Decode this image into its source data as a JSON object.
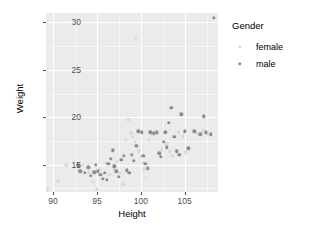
{
  "chart_data": {
    "type": "scatter",
    "title": "",
    "xlabel": "Height",
    "ylabel": "Weight",
    "xlim": [
      89.2,
      108.8
    ],
    "ylim": [
      12.1,
      31.0
    ],
    "xticks": [
      90,
      95,
      100,
      105
    ],
    "yticks": [
      15,
      20,
      25,
      30
    ],
    "grid": true,
    "legend": {
      "title": "Gender",
      "position": "right",
      "entries": [
        {
          "name": "female",
          "color": "#d9d9d9"
        },
        {
          "name": "male",
          "color": "#8c8c8c"
        }
      ]
    },
    "series": [
      {
        "name": "female",
        "color": "#d9d9d9",
        "points": [
          [
            89.4,
            12.4
          ],
          [
            90.6,
            13.3
          ],
          [
            91.5,
            14.9
          ],
          [
            93.0,
            14.4
          ],
          [
            93.4,
            15.0
          ],
          [
            94.1,
            14.2
          ],
          [
            94.6,
            13.2
          ],
          [
            95.0,
            12.4
          ],
          [
            95.3,
            14.5
          ],
          [
            95.6,
            14.0
          ],
          [
            96.0,
            15.2
          ],
          [
            96.4,
            13.9
          ],
          [
            96.9,
            14.6
          ],
          [
            97.3,
            15.3
          ],
          [
            97.6,
            14.1
          ],
          [
            98.0,
            12.9
          ],
          [
            98.3,
            17.6
          ],
          [
            98.6,
            19.7
          ],
          [
            98.9,
            18.3
          ],
          [
            99.1,
            17.9
          ],
          [
            99.3,
            17.4
          ],
          [
            99.4,
            28.4
          ],
          [
            99.6,
            16.9
          ],
          [
            99.8,
            16.4
          ],
          [
            100.0,
            15.8
          ],
          [
            100.2,
            15.2
          ],
          [
            100.4,
            14.5
          ],
          [
            100.6,
            13.6
          ],
          [
            100.9,
            17.6
          ],
          [
            101.3,
            18.2
          ],
          [
            101.9,
            18.3
          ],
          [
            102.4,
            16.6
          ],
          [
            102.9,
            17.2
          ],
          [
            103.3,
            16.4
          ],
          [
            103.6,
            15.9
          ],
          [
            104.0,
            16.5
          ],
          [
            104.3,
            18.4
          ],
          [
            104.8,
            18.0
          ],
          [
            105.1,
            16.3
          ],
          [
            106.4,
            18.3
          ],
          [
            107.1,
            18.6
          ],
          [
            107.6,
            18.3
          ]
        ]
      },
      {
        "name": "male",
        "color": "#8c8c8c",
        "points": [
          [
            92.9,
            14.9
          ],
          [
            93.1,
            14.3
          ],
          [
            93.6,
            14.1
          ],
          [
            94.0,
            14.7
          ],
          [
            94.3,
            13.8
          ],
          [
            94.7,
            14.2
          ],
          [
            94.9,
            15.0
          ],
          [
            95.1,
            14.3
          ],
          [
            95.4,
            13.9
          ],
          [
            95.7,
            13.5
          ],
          [
            95.9,
            14.1
          ],
          [
            96.1,
            13.4
          ],
          [
            96.3,
            15.1
          ],
          [
            96.6,
            15.6
          ],
          [
            96.8,
            16.5
          ],
          [
            97.0,
            14.8
          ],
          [
            97.2,
            14.3
          ],
          [
            97.5,
            13.7
          ],
          [
            97.8,
            15.5
          ],
          [
            98.1,
            15.9
          ],
          [
            98.4,
            14.4
          ],
          [
            98.7,
            14.1
          ],
          [
            99.0,
            16.0
          ],
          [
            99.2,
            15.4
          ],
          [
            99.5,
            17.0
          ],
          [
            99.7,
            18.5
          ],
          [
            100.1,
            18.4
          ],
          [
            100.3,
            15.9
          ],
          [
            100.5,
            15.1
          ],
          [
            100.8,
            14.6
          ],
          [
            101.1,
            18.4
          ],
          [
            101.5,
            18.3
          ],
          [
            101.8,
            18.4
          ],
          [
            102.1,
            16.2
          ],
          [
            102.3,
            15.8
          ],
          [
            102.6,
            17.4
          ],
          [
            102.8,
            18.4
          ],
          [
            103.0,
            16.8
          ],
          [
            103.2,
            19.4
          ],
          [
            103.5,
            21.0
          ],
          [
            103.8,
            17.9
          ],
          [
            104.1,
            16.4
          ],
          [
            104.4,
            16.0
          ],
          [
            104.6,
            20.3
          ],
          [
            105.0,
            18.5
          ],
          [
            105.4,
            16.7
          ],
          [
            106.1,
            18.5
          ],
          [
            106.8,
            18.2
          ],
          [
            107.2,
            20.1
          ],
          [
            107.4,
            18.4
          ],
          [
            108.0,
            18.2
          ],
          [
            108.3,
            30.5
          ]
        ]
      }
    ]
  }
}
